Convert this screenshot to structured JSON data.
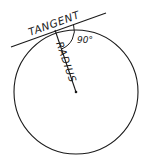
{
  "diagram": {
    "type": "geometry-tangent-radius",
    "labels": {
      "tangent": "TANGENT",
      "radius": "RADIUS",
      "angle": "90°"
    },
    "circle": {
      "cx": 76,
      "cy": 92,
      "r": 62
    },
    "tangent_line": {
      "x1": 11,
      "y1": 47,
      "x2": 106,
      "y2": 13
    },
    "radius_line": {
      "x1": 55,
      "y1": 30,
      "x2": 76,
      "y2": 92
    },
    "tangent_point": {
      "x": 55,
      "y": 31
    },
    "colors": {
      "stroke": "#1a1a1a",
      "background": "#ffffff"
    }
  }
}
